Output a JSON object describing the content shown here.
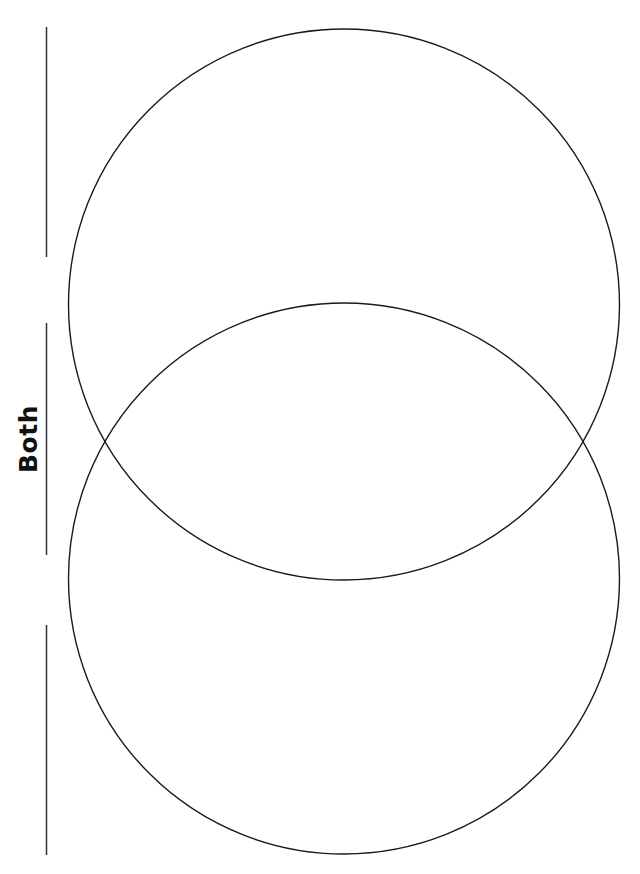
{
  "worksheet": {
    "type": "Venn diagram worksheet",
    "middle_label": "Both",
    "circles": [
      {
        "name": "top-circle",
        "cx": 344,
        "cy": 304.5,
        "r": 275.5
      },
      {
        "name": "bottom-circle",
        "cx": 344,
        "cy": 578.5,
        "r": 275.5
      }
    ],
    "write_lines": [
      {
        "name": "top-write-line",
        "x": 46.5,
        "y1": 27,
        "y2": 257
      },
      {
        "name": "middle-write-line",
        "x": 46.5,
        "y1": 323,
        "y2": 555
      },
      {
        "name": "bottom-write-line",
        "x": 46.5,
        "y1": 625,
        "y2": 855
      }
    ],
    "colors": {
      "stroke": "#1a1a1a",
      "background": "#ffffff"
    }
  }
}
